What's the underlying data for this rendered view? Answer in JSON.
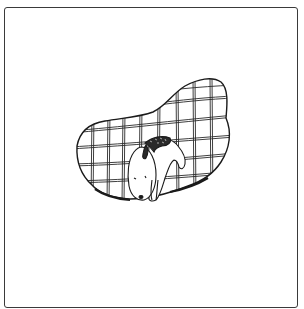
{
  "illustration": {
    "subject": "sleeping dog curled on a plaid blanket",
    "caption": "",
    "colors": {
      "frame_border": "#3a3a3a",
      "line": "#1a1a1a",
      "background": "#ffffff",
      "fill": "#ffffff",
      "pattern_dark": "#2a2a2a"
    }
  }
}
